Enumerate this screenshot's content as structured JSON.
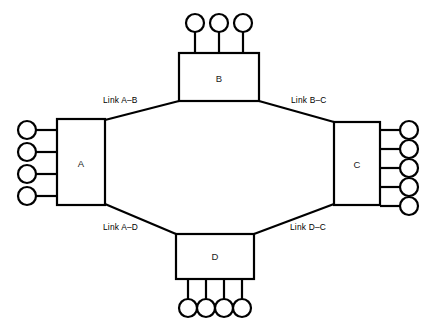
{
  "diagram": {
    "colors": {
      "stroke": "#000000",
      "fill": "#ffffff",
      "text": "#1a1a1a",
      "background": "#ffffff"
    },
    "nodes": [
      {
        "id": "A",
        "label": "A",
        "position": "left",
        "terminal_count": 4,
        "terminal_side": "left"
      },
      {
        "id": "B",
        "label": "B",
        "position": "top",
        "terminal_count": 3,
        "terminal_side": "top"
      },
      {
        "id": "C",
        "label": "C",
        "position": "right",
        "terminal_count": 5,
        "terminal_side": "right"
      },
      {
        "id": "D",
        "label": "D",
        "position": "bottom",
        "terminal_count": 4,
        "terminal_side": "bottom"
      }
    ],
    "links": [
      {
        "id": "a-b",
        "label": "Link A–B",
        "from": "A",
        "to": "B"
      },
      {
        "id": "b-c",
        "label": "Link B–C",
        "from": "B",
        "to": "C"
      },
      {
        "id": "a-d",
        "label": "Link A–D",
        "from": "A",
        "to": "D"
      },
      {
        "id": "d-c",
        "label": "Link D–C",
        "from": "D",
        "to": "C"
      }
    ]
  }
}
